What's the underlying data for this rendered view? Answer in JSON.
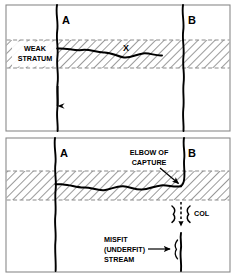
{
  "figure": {
    "background_color": "#ffffff",
    "stroke_color": "#000000",
    "hatch_color": "#666666",
    "width": 236,
    "height": 277
  },
  "panels": [
    {
      "id": "panel-before",
      "order": 1,
      "caption": "",
      "streams": [
        {
          "name": "A",
          "label": "A",
          "has_flow_arrow": true,
          "flow_direction": "down"
        },
        {
          "name": "B",
          "label": "B",
          "has_flow_arrow": false
        }
      ],
      "labels": [
        {
          "name": "weak-stratum-label",
          "text": "WEAK\nSTRATUM",
          "line1": "WEAK",
          "line2": "STRATUM"
        },
        {
          "name": "tributary-x-label",
          "text": "X"
        }
      ],
      "stratum": {
        "name": "weak-stratum-band",
        "fill": "hatched",
        "label": "WEAK STRATUM"
      }
    },
    {
      "id": "panel-after",
      "order": 2,
      "caption": "",
      "streams": [
        {
          "name": "A",
          "label": "A",
          "has_flow_arrow": false
        },
        {
          "name": "B",
          "label": "B",
          "has_flow_arrow": false
        }
      ],
      "labels": [
        {
          "name": "elbow-of-capture-label",
          "line1": "ELBOW OF",
          "line2": "CAPTURE"
        },
        {
          "name": "col-label",
          "text": "COL"
        },
        {
          "name": "misfit-stream-label",
          "line1": "MISFIT",
          "line2": "(UNDERFIT)",
          "line3": "STREAM"
        }
      ],
      "stratum": {
        "name": "weak-stratum-band",
        "fill": "hatched"
      }
    }
  ],
  "text": {
    "label_a": "A",
    "label_b": "B",
    "label_x": "X",
    "weak_line1": "WEAK",
    "weak_line2": "STRATUM",
    "elbow_line1": "ELBOW OF",
    "elbow_line2": "CAPTURE",
    "col": "COL",
    "misfit_line1": "MISFIT",
    "misfit_line2": "(UNDERFIT)",
    "misfit_line3": "STREAM"
  }
}
